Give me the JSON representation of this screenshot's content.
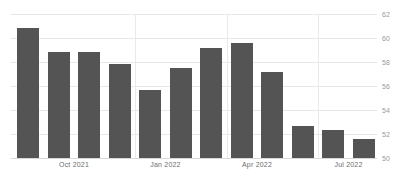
{
  "chart_data": {
    "type": "bar",
    "title": "",
    "subtitle": "",
    "xlabel": "",
    "ylabel": "",
    "ylim": [
      50,
      62
    ],
    "yticks": [
      50,
      52,
      54,
      56,
      58,
      60,
      62
    ],
    "grid": true,
    "legend": null,
    "bar_color": "#545454",
    "grid_color": "#e8e8e8",
    "categories": [
      "Sep 2021",
      "Oct 2021",
      "Nov 2021",
      "Dec 2021",
      "Jan 2022",
      "Feb 2022",
      "Mar 2022",
      "Apr 2022",
      "May 2022",
      "Jun 2022",
      "Jul 2022",
      "Aug 2022"
    ],
    "values": [
      60.8,
      58.8,
      58.8,
      57.8,
      55.7,
      57.5,
      59.2,
      59.6,
      57.2,
      52.7,
      52.3,
      51.6
    ],
    "xtick_labels": [
      "Oct 2021",
      "Jan 2022",
      "Apr 2022",
      "Jul 2022"
    ],
    "xtick_indices": [
      1,
      4,
      7,
      10
    ],
    "vertical_gridline_indices": [
      4,
      7,
      10
    ]
  }
}
